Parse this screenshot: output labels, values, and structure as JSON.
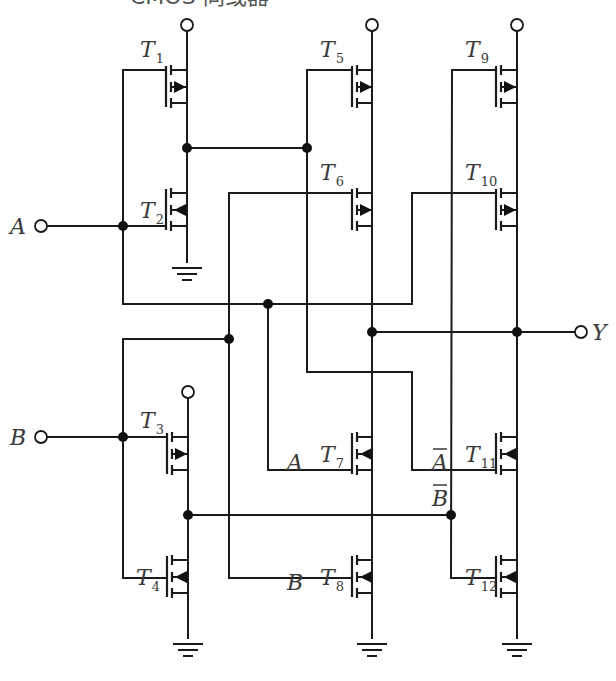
{
  "title": "CMOS 同或器",
  "colors": {
    "wire": "#1a1a1a",
    "label": "#3a3a3a",
    "background": "#ffffff"
  },
  "inputs": [
    {
      "name": "A",
      "x": 40,
      "y": 226
    },
    {
      "name": "B",
      "x": 40,
      "y": 437
    }
  ],
  "output": {
    "name": "Y",
    "x": 581,
    "y": 332
  },
  "transistors": [
    {
      "id": "T1",
      "label": "T",
      "sub": "1",
      "type": "pmos",
      "x": 187,
      "ytop": 70,
      "gate_x": 166,
      "lx": 140,
      "ly": 57
    },
    {
      "id": "T2",
      "label": "T",
      "sub": "2",
      "type": "nmos",
      "x": 187,
      "ytop": 193,
      "gate_x": 166,
      "lx": 140,
      "ly": 218
    },
    {
      "id": "T3",
      "label": "T",
      "sub": "3",
      "type": "pmos",
      "x": 188,
      "ytop": 437,
      "gate_x": 167,
      "lx": 140,
      "ly": 428
    },
    {
      "id": "T4",
      "label": "T",
      "sub": "4",
      "type": "nmos",
      "x": 188,
      "ytop": 560,
      "gate_x": 167,
      "lx": 136,
      "ly": 585
    },
    {
      "id": "T5",
      "label": "T",
      "sub": "5",
      "type": "pmos",
      "x": 372,
      "ytop": 70,
      "gate_x": 352,
      "lx": 320,
      "ly": 57
    },
    {
      "id": "T6",
      "label": "T",
      "sub": "6",
      "type": "pmos",
      "x": 372,
      "ytop": 193,
      "gate_x": 352,
      "lx": 320,
      "ly": 180
    },
    {
      "id": "T7",
      "label": "T",
      "sub": "7",
      "type": "nmos",
      "x": 372,
      "ytop": 437,
      "gate_x": 352,
      "lx": 320,
      "ly": 462
    },
    {
      "id": "T8",
      "label": "T",
      "sub": "8",
      "type": "nmos",
      "x": 372,
      "ytop": 560,
      "gate_x": 352,
      "lx": 320,
      "ly": 585
    },
    {
      "id": "T9",
      "label": "T",
      "sub": "9",
      "type": "pmos",
      "x": 517,
      "ytop": 70,
      "gate_x": 496,
      "lx": 465,
      "ly": 57
    },
    {
      "id": "T10",
      "label": "T",
      "sub": "10",
      "type": "pmos",
      "x": 517,
      "ytop": 193,
      "gate_x": 496,
      "lx": 465,
      "ly": 180
    },
    {
      "id": "T11",
      "label": "T",
      "sub": "11",
      "type": "nmos",
      "x": 517,
      "ytop": 437,
      "gate_x": 496,
      "lx": 465,
      "ly": 462
    },
    {
      "id": "T12",
      "label": "T",
      "sub": "12",
      "type": "nmos",
      "x": 517,
      "ytop": 560,
      "gate_x": 496,
      "lx": 465,
      "ly": 585
    }
  ],
  "gate_labels": [
    {
      "text": "A",
      "overbar": false,
      "x": 287,
      "y": 470
    },
    {
      "text": "A",
      "overbar": true,
      "x": 432,
      "y": 470
    },
    {
      "text": "B",
      "overbar": true,
      "x": 432,
      "y": 506
    },
    {
      "text": "B",
      "overbar": false,
      "x": 287,
      "y": 590
    }
  ],
  "vdd_terminals": [
    {
      "x": 187,
      "y": 25
    },
    {
      "x": 372,
      "y": 25
    },
    {
      "x": 517,
      "y": 25
    },
    {
      "x": 188,
      "y": 392
    }
  ],
  "grounds": [
    {
      "x": 187,
      "y": 268
    },
    {
      "x": 188,
      "y": 644
    },
    {
      "x": 372,
      "y": 644
    },
    {
      "x": 517,
      "y": 644
    }
  ],
  "junctions": [
    {
      "x": 187,
      "y": 148
    },
    {
      "x": 307,
      "y": 148
    },
    {
      "x": 123,
      "y": 226
    },
    {
      "x": 268,
      "y": 304
    },
    {
      "x": 229,
      "y": 339
    },
    {
      "x": 372,
      "y": 332
    },
    {
      "x": 517,
      "y": 332
    },
    {
      "x": 123,
      "y": 437
    },
    {
      "x": 188,
      "y": 515
    },
    {
      "x": 451,
      "y": 515
    }
  ],
  "wires": [
    "M187,31 L187,70",
    "M187,103 L187,193",
    "M187,148 L307,148",
    "M187,226 L187,262",
    "M123,70 L166,70",
    "M123,70 L123,304",
    "M47,226 L166,226",
    "M123,304 L412,304",
    "M412,304 L412,193",
    "M412,193 L496,193",
    "M268,304 L268,470",
    "M268,470 L352,470",
    "M307,70 L352,70",
    "M307,70 L307,372",
    "M307,372 L412,372",
    "M412,372 L412,470",
    "M412,470 L496,470",
    "M229,193 L352,193",
    "M229,193 L229,578",
    "M229,578 L352,578",
    "M123,339 L229,339",
    "M123,339 L123,578",
    "M123,578 L167,578",
    "M47,437 L123,437",
    "M123,437 L167,437",
    "M188,398 L188,437",
    "M188,470 L188,560",
    "M188,515 L451,515",
    "M188,593 L188,638",
    "M372,31 L372,70",
    "M372,103 L372,193",
    "M372,226 L372,437",
    "M372,332 L575,332",
    "M372,470 L372,560",
    "M372,593 L372,638",
    "M452,70 L496,70",
    "M452,70 L451,578",
    "M451,578 L496,578",
    "M517,31 L517,70",
    "M517,103 L517,193",
    "M517,226 L517,437",
    "M517,470 L517,560",
    "M517,593 L517,638"
  ]
}
